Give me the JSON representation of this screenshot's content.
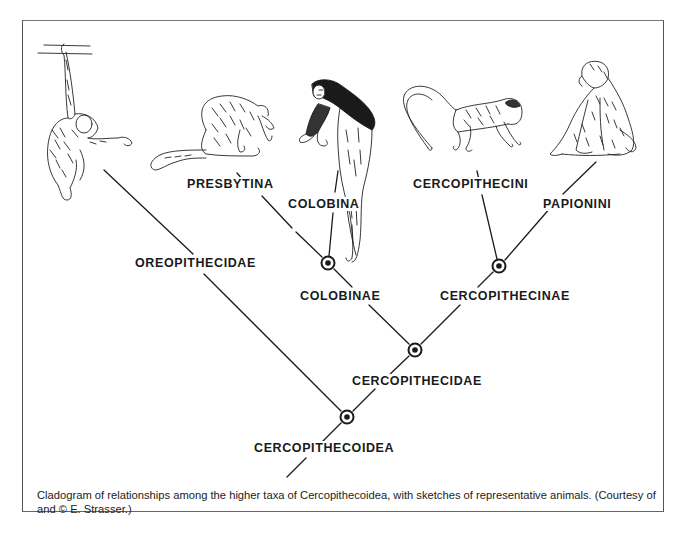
{
  "diagram": {
    "type": "cladogram",
    "colors": {
      "line": "#1a1a1a",
      "background": "#ffffff",
      "frame": "#555555"
    },
    "nodes": [
      {
        "id": "cercopithecoidea",
        "label": "CERCOPITHECOIDEA",
        "x": 347,
        "y": 417
      },
      {
        "id": "cercopithecidae",
        "label": "CERCOPITHECIDAE",
        "x": 415,
        "y": 350
      },
      {
        "id": "colobinae",
        "label": "COLOBINAE",
        "x": 328,
        "y": 263
      },
      {
        "id": "cercopithecinae",
        "label": "CERCOPITHECINAE",
        "x": 499,
        "y": 266
      }
    ],
    "terminals": [
      {
        "id": "oreopithecidae",
        "label": "OREOPITHECIDAE",
        "parent": "cercopithecoidea",
        "sketch": "hanging-ape"
      },
      {
        "id": "presbytina",
        "label": "PRESBYTINA",
        "parent": "colobinae",
        "sketch": "sitting-langur"
      },
      {
        "id": "colobina",
        "label": "COLOBINA",
        "parent": "colobinae",
        "sketch": "colobus-monkey"
      },
      {
        "id": "cercopithecini",
        "label": "CERCOPITHECINI",
        "parent": "cercopithecinae",
        "sketch": "walking-guenon"
      },
      {
        "id": "papionini",
        "label": "PAPIONINI",
        "parent": "cercopithecinae",
        "sketch": "sitting-baboon"
      }
    ],
    "labels": {
      "oreopithecidae": "OREOPITHECIDAE",
      "presbytina": "PRESBYTINA",
      "colobina": "COLOBINA",
      "cercopithecini": "CERCOPITHECINI",
      "papionini": "PAPIONINI",
      "colobinae": "COLOBINAE",
      "cercopithecinae": "CERCOPITHECINAE",
      "cercopithecidae": "CERCOPITHECIDAE",
      "cercopithecoidea": "CERCOPITHECOIDEA"
    }
  },
  "caption": "Cladogram of relationships among the higher taxa of Cercopithecoidea, with sketches of representative animals.  (Courtesy of and © E. Strasser.)"
}
